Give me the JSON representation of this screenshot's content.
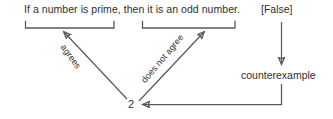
{
  "diagram": {
    "title_statement": "If a number is prime, then it is an odd number.",
    "truth_value_label": "[False]",
    "counterexample_label": "counterexample",
    "counterexample_value": "2",
    "hypothesis_relation_label": "agrees",
    "conclusion_relation_label": "does not agree",
    "colors": {
      "text": "#2f2f2f",
      "stroke": "#5a5a5a",
      "background": "#ffffff"
    },
    "brackets": [
      {
        "name": "hypothesis-bracket",
        "spans": "If a number is prime,"
      },
      {
        "name": "conclusion-bracket",
        "spans": "then it is an odd number."
      }
    ],
    "arrows": [
      {
        "name": "agrees-arrow",
        "from": "counterexample-value",
        "to": "hypothesis-bracket",
        "label": "agrees"
      },
      {
        "name": "does-not-agree-arrow",
        "from": "counterexample-value",
        "to": "conclusion-bracket",
        "label": "does not agree"
      },
      {
        "name": "false-to-counterexample-arrow",
        "from": "[False]",
        "to": "counterexample"
      },
      {
        "name": "counterexample-to-two-arrow",
        "from": "counterexample",
        "to": "2"
      }
    ]
  }
}
